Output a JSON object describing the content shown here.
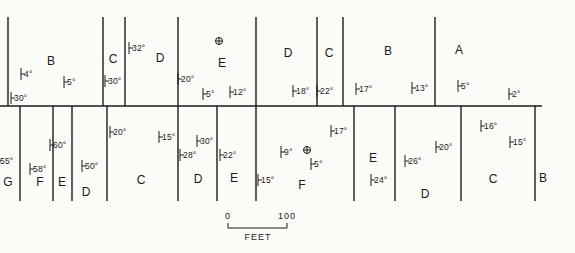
{
  "map": {
    "baseline": {
      "y": 106,
      "x1": 0,
      "x2": 542
    },
    "top_contacts_x": [
      8,
      103,
      125,
      178,
      256,
      317,
      343,
      435
    ],
    "top_contacts_y": [
      17,
      106
    ],
    "bottom_contacts_x": [
      20,
      53,
      72,
      107,
      178,
      217,
      256,
      354,
      395,
      461,
      535
    ],
    "bottom_contacts_y": [
      106,
      201
    ],
    "ink_color": "#1a1a1a",
    "background": "#fbfbf8"
  },
  "units_top": [
    {
      "label": "B",
      "x": 51,
      "y": 61
    },
    {
      "label": "C",
      "x": 113,
      "y": 59
    },
    {
      "label": "D",
      "x": 160,
      "y": 58
    },
    {
      "label": "E",
      "x": 222,
      "y": 63
    },
    {
      "label": "D",
      "x": 288,
      "y": 53
    },
    {
      "label": "C",
      "x": 329,
      "y": 53
    },
    {
      "label": "B",
      "x": 388,
      "y": 51
    },
    {
      "label": "A",
      "x": 459,
      "y": 50
    }
  ],
  "units_bottom": [
    {
      "label": "G",
      "x": 8,
      "y": 182
    },
    {
      "label": "F",
      "x": 40,
      "y": 182
    },
    {
      "label": "E",
      "x": 62,
      "y": 182
    },
    {
      "label": "D",
      "x": 86,
      "y": 192
    },
    {
      "label": "C",
      "x": 141,
      "y": 180
    },
    {
      "label": "D",
      "x": 198,
      "y": 179
    },
    {
      "label": "E",
      "x": 234,
      "y": 178
    },
    {
      "label": "F",
      "x": 302,
      "y": 185
    },
    {
      "label": "E",
      "x": 373,
      "y": 158
    },
    {
      "label": "D",
      "x": 425,
      "y": 194
    },
    {
      "label": "C",
      "x": 493,
      "y": 179
    },
    {
      "label": "B",
      "x": 543,
      "y": 178
    }
  ],
  "dips_top": [
    {
      "text": "30°",
      "x": 14,
      "y": 94
    },
    {
      "text": "4°",
      "x": 24,
      "y": 70
    },
    {
      "text": "5°",
      "x": 67,
      "y": 78
    },
    {
      "text": "30°",
      "x": 108,
      "y": 77
    },
    {
      "text": "32°",
      "x": 132,
      "y": 44
    },
    {
      "text": "20°",
      "x": 181,
      "y": 75
    },
    {
      "text": "5°",
      "x": 206,
      "y": 90
    },
    {
      "text": "12°",
      "x": 233,
      "y": 88
    },
    {
      "text": "18°",
      "x": 296,
      "y": 87
    },
    {
      "text": "22°",
      "x": 320,
      "y": 87
    },
    {
      "text": "17°",
      "x": 359,
      "y": 85
    },
    {
      "text": "13°",
      "x": 415,
      "y": 84
    },
    {
      "text": "5°",
      "x": 461,
      "y": 82
    },
    {
      "text": "2°",
      "x": 512,
      "y": 90
    }
  ],
  "dips_bottom": [
    {
      "text": "55°",
      "x": 0,
      "y": 157
    },
    {
      "text": "58°",
      "x": 33,
      "y": 165
    },
    {
      "text": "60°",
      "x": 53,
      "y": 141
    },
    {
      "text": "50°",
      "x": 85,
      "y": 162
    },
    {
      "text": "20°",
      "x": 113,
      "y": 128
    },
    {
      "text": "15°",
      "x": 162,
      "y": 133
    },
    {
      "text": "28°",
      "x": 183,
      "y": 151
    },
    {
      "text": "30°",
      "x": 200,
      "y": 137
    },
    {
      "text": "22°",
      "x": 223,
      "y": 151
    },
    {
      "text": "15°",
      "x": 261,
      "y": 176
    },
    {
      "text": "9°",
      "x": 284,
      "y": 148
    },
    {
      "text": "5°",
      "x": 314,
      "y": 160
    },
    {
      "text": "17°",
      "x": 334,
      "y": 127
    },
    {
      "text": "24°",
      "x": 374,
      "y": 176
    },
    {
      "text": "26°",
      "x": 408,
      "y": 157
    },
    {
      "text": "20°",
      "x": 439,
      "y": 143
    },
    {
      "text": "16°",
      "x": 484,
      "y": 122
    },
    {
      "text": "15°",
      "x": 513,
      "y": 138
    }
  ],
  "horizontal_beds": [
    {
      "symbol": "⊕",
      "x": 219,
      "y": 41
    },
    {
      "symbol": "⊕",
      "x": 307,
      "y": 150
    }
  ],
  "scale": {
    "start_label": "0",
    "end_label": "100",
    "units": "FEET",
    "x1": 228,
    "x2": 287,
    "y": 228
  }
}
